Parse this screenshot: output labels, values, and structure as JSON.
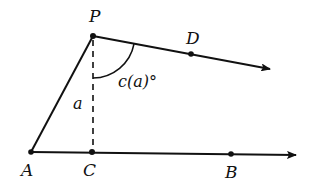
{
  "diagram": {
    "points": {
      "P": "P",
      "D": "D",
      "A": "A",
      "C": "C",
      "B": "B"
    },
    "labels": {
      "height": "a",
      "angle": "c(a)°"
    },
    "colors": {
      "ink": "#111111",
      "background": "#ffffff"
    }
  }
}
